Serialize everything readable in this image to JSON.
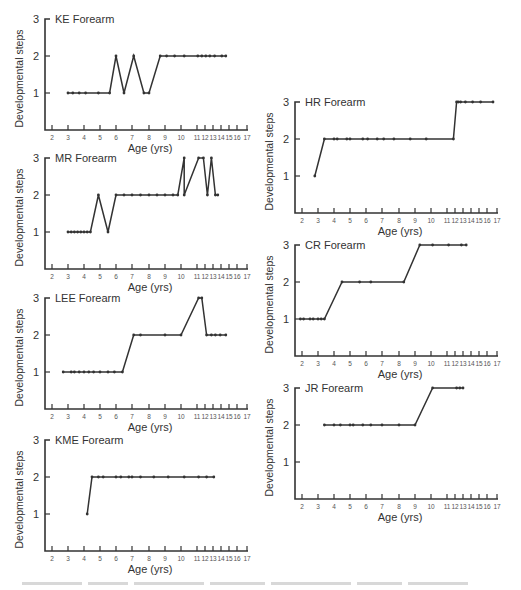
{
  "figure": {
    "ylabel": "Developmental steps",
    "xlabel": "Age (yrs)",
    "yticks": [
      1,
      2,
      3
    ],
    "xticks": [
      2,
      3,
      4,
      5,
      6,
      7,
      8,
      9,
      10,
      11,
      12,
      13,
      14,
      15,
      16,
      17
    ],
    "line_color": "#333333",
    "marker_color": "#333333"
  },
  "chart_data": [
    {
      "type": "line",
      "title": "KE Forearm",
      "xlabel": "Age (yrs)",
      "ylabel": "Developmental steps",
      "ylim": [
        0,
        3
      ],
      "xticks": [
        2,
        3,
        4,
        5,
        6,
        7,
        8,
        9,
        10,
        11,
        12,
        13,
        14,
        15,
        16,
        17
      ],
      "grid": false,
      "x": [
        3.0,
        3.3,
        3.7,
        4.1,
        4.9,
        5.6,
        6.0,
        6.5,
        7.1,
        7.7,
        8.0,
        8.7,
        9.1,
        9.6,
        10.2,
        11.1,
        11.6,
        12.1,
        12.6,
        13.2,
        14.1,
        14.6
      ],
      "y": [
        1,
        1,
        1,
        1,
        1,
        1,
        2,
        1,
        2,
        1,
        1,
        2,
        2,
        2,
        2,
        2,
        2,
        2,
        2,
        2,
        2,
        2
      ]
    },
    {
      "type": "line",
      "title": "MR Forearm",
      "xlabel": "Age (yrs)",
      "ylabel": "Developmental steps",
      "ylim": [
        0,
        3
      ],
      "xticks": [
        2,
        3,
        4,
        5,
        6,
        7,
        8,
        9,
        10,
        11,
        12,
        13,
        14,
        15,
        16,
        17
      ],
      "grid": false,
      "x": [
        3.0,
        3.2,
        3.4,
        3.6,
        3.8,
        4.0,
        4.2,
        4.4,
        4.9,
        5.5,
        6.0,
        6.5,
        7.0,
        7.5,
        8.0,
        8.5,
        9.0,
        9.5,
        9.8,
        10.2,
        10.2,
        11.2,
        11.8,
        12.3,
        12.8,
        13.3,
        13.6
      ],
      "y": [
        1,
        1,
        1,
        1,
        1,
        1,
        1,
        1,
        2,
        1,
        2,
        2,
        2,
        2,
        2,
        2,
        2,
        2,
        2,
        3,
        2,
        3,
        3,
        2,
        3,
        2,
        2
      ]
    },
    {
      "type": "line",
      "title": "LEE Forearm",
      "xlabel": "Age (yrs)",
      "ylabel": "Developmental steps",
      "ylim": [
        0,
        3
      ],
      "xticks": [
        2,
        3,
        4,
        5,
        6,
        7,
        8,
        9,
        10,
        11,
        12,
        13,
        14,
        15,
        16,
        17
      ],
      "grid": false,
      "x": [
        2.7,
        3.2,
        3.4,
        3.7,
        4.0,
        4.3,
        4.6,
        5.0,
        5.5,
        5.9,
        6.4,
        7.1,
        7.5,
        9.0,
        10.0,
        11.2,
        11.6,
        12.2,
        12.8,
        13.3,
        13.9,
        14.6
      ],
      "y": [
        1,
        1,
        1,
        1,
        1,
        1,
        1,
        1,
        1,
        1,
        1,
        2,
        2,
        2,
        2,
        3,
        3,
        2,
        2,
        2,
        2,
        2
      ]
    },
    {
      "type": "line",
      "title": "KME Forearm",
      "xlabel": "Age (yrs)",
      "ylabel": "Developmental steps",
      "ylim": [
        0,
        3
      ],
      "xticks": [
        2,
        3,
        4,
        5,
        6,
        7,
        8,
        9,
        10,
        11,
        12,
        13,
        14,
        15,
        16,
        17
      ],
      "grid": false,
      "x": [
        4.2,
        4.5,
        4.9,
        5.2,
        6.0,
        6.3,
        6.8,
        7.0,
        7.5,
        8.3,
        9.2,
        10.2,
        11.2,
        12.2,
        13.1
      ],
      "y": [
        1,
        2,
        2,
        2,
        2,
        2,
        2,
        2,
        2,
        2,
        2,
        2,
        2,
        2,
        2
      ]
    },
    {
      "type": "line",
      "title": "HR Forearm",
      "xlabel": "Age (yrs)",
      "ylabel": "Developmental steps",
      "ylim": [
        0,
        3
      ],
      "xticks": [
        2,
        3,
        4,
        5,
        6,
        7,
        8,
        9,
        10,
        11,
        12,
        13,
        14,
        15,
        16,
        17
      ],
      "grid": false,
      "x": [
        2.8,
        3.4,
        4.0,
        4.2,
        4.8,
        5.0,
        5.8,
        6.1,
        6.7,
        7.1,
        7.7,
        8.7,
        9.7,
        11.8,
        12.2,
        12.4,
        12.7,
        13.3,
        14.2,
        15.2,
        16.6
      ],
      "y": [
        1,
        2,
        2,
        2,
        2,
        2,
        2,
        2,
        2,
        2,
        2,
        2,
        2,
        2,
        3,
        3,
        3,
        3,
        3,
        3,
        3
      ]
    },
    {
      "type": "line",
      "title": "CR Forearm",
      "xlabel": "Age (yrs)",
      "ylabel": "Developmental steps",
      "ylim": [
        0,
        3
      ],
      "xticks": [
        2,
        3,
        4,
        5,
        6,
        7,
        8,
        9,
        10,
        11,
        12,
        13,
        14,
        15,
        16,
        17
      ],
      "grid": false,
      "x": [
        1.9,
        2.1,
        2.5,
        2.7,
        3.0,
        3.2,
        3.4,
        4.5,
        5.6,
        6.3,
        8.3,
        9.3,
        10.1,
        11.2,
        12.8,
        13.4
      ],
      "y": [
        1,
        1,
        1,
        1,
        1,
        1,
        1,
        2,
        2,
        2,
        2,
        3,
        3,
        3,
        3,
        3
      ]
    },
    {
      "type": "line",
      "title": "JR Forearm",
      "xlabel": "Age (yrs)",
      "ylabel": "Developmental steps",
      "ylim": [
        0,
        3
      ],
      "xticks": [
        2,
        3,
        4,
        5,
        6,
        7,
        8,
        9,
        10,
        11,
        12,
        13,
        14,
        15,
        16,
        17
      ],
      "grid": false,
      "x": [
        3.4,
        4.0,
        4.4,
        5.0,
        5.2,
        5.8,
        6.3,
        7.0,
        8.0,
        9.0,
        10.1,
        12.2,
        12.6,
        13.0
      ],
      "y": [
        2,
        2,
        2,
        2,
        2,
        2,
        2,
        2,
        2,
        2,
        3,
        3,
        3,
        3
      ]
    }
  ],
  "layout": {
    "panels": [
      {
        "index": 0,
        "left": 0,
        "top": 8
      },
      {
        "index": 1,
        "left": 0,
        "top": 147
      },
      {
        "index": 2,
        "left": 0,
        "top": 287
      },
      {
        "index": 3,
        "left": 0,
        "top": 429
      },
      {
        "index": 4,
        "left": 250,
        "top": 91
      },
      {
        "index": 5,
        "left": 250,
        "top": 234
      },
      {
        "index": 6,
        "left": 250,
        "top": 377
      }
    ]
  }
}
